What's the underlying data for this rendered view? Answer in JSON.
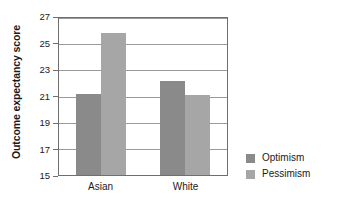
{
  "chart_data": {
    "type": "bar",
    "title": "",
    "subtitle": "",
    "xlabel": "",
    "ylabel": "Outcome expectancy score",
    "categories": [
      "Asian",
      "White"
    ],
    "series": [
      {
        "name": "Optimism",
        "color": "#8a8a8a",
        "values": [
          21.2,
          22.2
        ]
      },
      {
        "name": "Pessimism",
        "color": "#a6a6a6",
        "values": [
          25.85,
          21.1
        ]
      }
    ],
    "ylim": [
      15,
      27
    ],
    "ytick_step": 2,
    "yticks": [
      27,
      25,
      23,
      21,
      19,
      17,
      15
    ],
    "ytick_labels": [
      "27",
      "25",
      "23",
      "21",
      "19",
      "17",
      "15"
    ],
    "grid": "horizontal",
    "legend_position": "right",
    "axis_color": "#6f6f6f",
    "grid_color": "#9a9a9a",
    "background": "#ffffff"
  },
  "legend": {
    "items": [
      {
        "label": "Optimism"
      },
      {
        "label": "Pessimism"
      }
    ]
  },
  "axis": {
    "y_title": "Outcome expectancy score"
  }
}
